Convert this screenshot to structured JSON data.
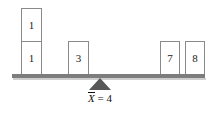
{
  "diagram": {
    "type": "balance-beam-mean-diagram",
    "title": "",
    "mean_label": {
      "variable": "X",
      "has_overbar": true,
      "equals": "=",
      "value": "4",
      "full_text": "X̄ = 4"
    },
    "beam": {
      "color": "#7d7d7d",
      "shadow_color": "#cfcfcf"
    },
    "fulcrum": {
      "color": "#585858",
      "position_value": "4"
    },
    "box_style": {
      "fill": "#ffffff",
      "border_color": "#8a8a8a",
      "text_color": "#1a1a1a"
    },
    "boxes": [
      {
        "id": "box-1-top",
        "label": "1",
        "stack_index": 1
      },
      {
        "id": "box-1-bottom",
        "label": "1",
        "stack_index": 0
      },
      {
        "id": "box-3",
        "label": "3",
        "stack_index": 0
      },
      {
        "id": "box-7",
        "label": "7",
        "stack_index": 0
      },
      {
        "id": "box-8",
        "label": "8",
        "stack_index": 0
      }
    ]
  },
  "chart_data": {
    "type": "bar",
    "xlabel": "",
    "ylabel": "",
    "categories": [
      "1",
      "3",
      "7",
      "8"
    ],
    "values": [
      2,
      1,
      1,
      1
    ],
    "data_points": [
      1,
      1,
      3,
      7,
      8
    ],
    "mean": 4,
    "xlim": [
      0,
      9
    ],
    "grid": false,
    "legend": false,
    "annotations": [
      "X̄ = 4"
    ]
  }
}
